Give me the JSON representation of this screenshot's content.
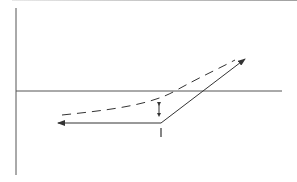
{
  "diagram": {
    "type": "line-diagram",
    "colors": {
      "line": "#333333",
      "axis": "#444444",
      "background": "#ffffff"
    },
    "axes": {
      "vertical": {
        "x": 16,
        "y1": 8,
        "y2": 175
      },
      "horizontal": {
        "y": 91,
        "x1": 16,
        "x2": 282
      }
    },
    "labels": {
      "vertex_label": "I"
    },
    "elements": [
      {
        "name": "solid-path",
        "description": "Solid line from left arrowhead to vertex then up-right to arrowhead"
      },
      {
        "name": "dashed-curve",
        "description": "Dashed curve above solid path rising to upper right"
      },
      {
        "name": "offset-arrow",
        "description": "Small double-headed vertical arrow between dashed and solid line"
      }
    ]
  }
}
